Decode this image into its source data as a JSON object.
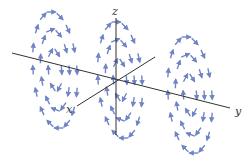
{
  "figure": {
    "axes": {
      "x_label": "x",
      "y_label": "y",
      "z_label": "z",
      "color": "#333333"
    },
    "arrow_color": "#6f84c4",
    "loops": [
      {
        "name": "left-loop",
        "cx": 55,
        "cy": 70,
        "rings": [
          {
            "rx": 40,
            "ry": 58,
            "n": 16
          },
          {
            "rx": 26,
            "ry": 40,
            "n": 11
          },
          {
            "rx": 12,
            "ry": 20,
            "n": 6
          }
        ]
      },
      {
        "name": "center-loop",
        "cx": 120,
        "cy": 80,
        "rings": [
          {
            "rx": 40,
            "ry": 58,
            "n": 16
          },
          {
            "rx": 26,
            "ry": 40,
            "n": 11
          },
          {
            "rx": 12,
            "ry": 20,
            "n": 6
          }
        ]
      },
      {
        "name": "right-loop",
        "cx": 190,
        "cy": 95,
        "rings": [
          {
            "rx": 40,
            "ry": 58,
            "n": 16
          },
          {
            "rx": 26,
            "ry": 40,
            "n": 11
          },
          {
            "rx": 12,
            "ry": 20,
            "n": 6
          }
        ]
      }
    ]
  }
}
